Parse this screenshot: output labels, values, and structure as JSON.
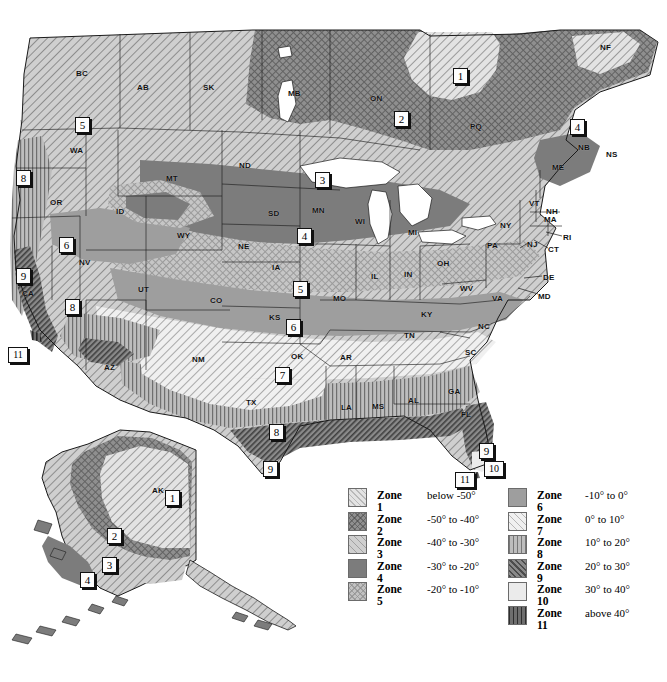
{
  "background": "#ffffff",
  "legend": {
    "left_column": [
      {
        "zone": "Zone 1",
        "range": "below -50°",
        "swatch": "z1"
      },
      {
        "zone": "Zone 2",
        "range": "-50° to -40°",
        "swatch": "z2"
      },
      {
        "zone": "Zone 3",
        "range": "-40° to -30°",
        "swatch": "z3"
      },
      {
        "zone": "Zone 4",
        "range": "-30° to -20°",
        "swatch": "z4"
      },
      {
        "zone": "Zone 5",
        "range": "-20° to -10°",
        "swatch": "z5"
      }
    ],
    "right_column": [
      {
        "zone": "Zone 6",
        "range": "-10° to 0°",
        "swatch": "z6"
      },
      {
        "zone": "Zone 7",
        "range": "0° to 10°",
        "swatch": "z7"
      },
      {
        "zone": "Zone 8",
        "range": "10° to 20°",
        "swatch": "z8"
      },
      {
        "zone": "Zone 9",
        "range": "20° to 30°",
        "swatch": "z9"
      },
      {
        "zone": "Zone 10",
        "range": "30° to 40°",
        "swatch": "z10"
      },
      {
        "zone": "Zone 11",
        "range": "above 40°",
        "swatch": "z11"
      }
    ]
  },
  "zone_colors": {
    "zone1": "#e3e3e3",
    "zone2": "#8f8f8f",
    "zone3": "#cfcfcf",
    "zone4": "#7c7c7c",
    "zone5": "#c2c2c2",
    "zone6": "#9e9e9e",
    "zone7": "#f0f0f0",
    "zone8": "#bdbdbd",
    "zone9": "#8a8a8a",
    "zone10": "#ebebeb",
    "zone11": "#6e6e6e",
    "water": "#ffffff",
    "border": "#1a1a1a"
  },
  "region_labels": [
    {
      "text": "BC",
      "x": 76,
      "y": 69
    },
    {
      "text": "AB",
      "x": 137,
      "y": 83
    },
    {
      "text": "SK",
      "x": 203,
      "y": 83
    },
    {
      "text": "MB",
      "x": 288,
      "y": 89
    },
    {
      "text": "ON",
      "x": 370,
      "y": 94
    },
    {
      "text": "PQ",
      "x": 470,
      "y": 122
    },
    {
      "text": "NF",
      "x": 600,
      "y": 43
    },
    {
      "text": "NB",
      "x": 578,
      "y": 143
    },
    {
      "text": "NS",
      "x": 606,
      "y": 150
    },
    {
      "text": "ME",
      "x": 552,
      "y": 163
    },
    {
      "text": "WA",
      "x": 70,
      "y": 146
    },
    {
      "text": "OR",
      "x": 50,
      "y": 198
    },
    {
      "text": "ID",
      "x": 116,
      "y": 207
    },
    {
      "text": "MT",
      "x": 166,
      "y": 174
    },
    {
      "text": "ND",
      "x": 239,
      "y": 161
    },
    {
      "text": "SD",
      "x": 268,
      "y": 209
    },
    {
      "text": "MN",
      "x": 312,
      "y": 206
    },
    {
      "text": "WI",
      "x": 355,
      "y": 217
    },
    {
      "text": "MI",
      "x": 408,
      "y": 228
    },
    {
      "text": "NY",
      "x": 500,
      "y": 221
    },
    {
      "text": "VT",
      "x": 529,
      "y": 199
    },
    {
      "text": "NH",
      "x": 546,
      "y": 207
    },
    {
      "text": "MA",
      "x": 544,
      "y": 215
    },
    {
      "text": "RI",
      "x": 563,
      "y": 233
    },
    {
      "text": "CT",
      "x": 548,
      "y": 245
    },
    {
      "text": "NJ",
      "x": 527,
      "y": 240
    },
    {
      "text": "PA",
      "x": 487,
      "y": 241
    },
    {
      "text": "DE",
      "x": 543,
      "y": 273
    },
    {
      "text": "MD",
      "x": 538,
      "y": 292
    },
    {
      "text": "OH",
      "x": 437,
      "y": 259
    },
    {
      "text": "IN",
      "x": 404,
      "y": 270
    },
    {
      "text": "IL",
      "x": 371,
      "y": 272
    },
    {
      "text": "IA",
      "x": 272,
      "y": 263
    },
    {
      "text": "NE",
      "x": 238,
      "y": 242
    },
    {
      "text": "WY",
      "x": 177,
      "y": 231
    },
    {
      "text": "NV",
      "x": 79,
      "y": 258
    },
    {
      "text": "UT",
      "x": 138,
      "y": 285
    },
    {
      "text": "CA",
      "x": 22,
      "y": 289
    },
    {
      "text": "CO",
      "x": 210,
      "y": 296
    },
    {
      "text": "KS",
      "x": 269,
      "y": 313
    },
    {
      "text": "MO",
      "x": 333,
      "y": 294
    },
    {
      "text": "KY",
      "x": 421,
      "y": 310
    },
    {
      "text": "WV",
      "x": 460,
      "y": 284
    },
    {
      "text": "VA",
      "x": 492,
      "y": 294
    },
    {
      "text": "NC",
      "x": 478,
      "y": 322
    },
    {
      "text": "SC",
      "x": 465,
      "y": 348
    },
    {
      "text": "TN",
      "x": 404,
      "y": 331
    },
    {
      "text": "AR",
      "x": 340,
      "y": 353
    },
    {
      "text": "OK",
      "x": 291,
      "y": 352
    },
    {
      "text": "NM",
      "x": 192,
      "y": 355
    },
    {
      "text": "AZ",
      "x": 104,
      "y": 363
    },
    {
      "text": "TX",
      "x": 246,
      "y": 398
    },
    {
      "text": "LA",
      "x": 341,
      "y": 403
    },
    {
      "text": "MS",
      "x": 372,
      "y": 402
    },
    {
      "text": "AL",
      "x": 408,
      "y": 396
    },
    {
      "text": "GA",
      "x": 448,
      "y": 387
    },
    {
      "text": "FL",
      "x": 461,
      "y": 410
    },
    {
      "text": "AK",
      "x": 152,
      "y": 486
    }
  ],
  "zone_markers": [
    {
      "zone": "1",
      "x": 453,
      "y": 68
    },
    {
      "zone": "2",
      "x": 394,
      "y": 111
    },
    {
      "zone": "4",
      "x": 570,
      "y": 119
    },
    {
      "zone": "5",
      "x": 75,
      "y": 117
    },
    {
      "zone": "8",
      "x": 16,
      "y": 170
    },
    {
      "zone": "3",
      "x": 315,
      "y": 172
    },
    {
      "zone": "6",
      "x": 59,
      "y": 237
    },
    {
      "zone": "4",
      "x": 297,
      "y": 228
    },
    {
      "zone": "9",
      "x": 16,
      "y": 268
    },
    {
      "zone": "5",
      "x": 293,
      "y": 281
    },
    {
      "zone": "8",
      "x": 65,
      "y": 299
    },
    {
      "zone": "6",
      "x": 286,
      "y": 319
    },
    {
      "zone": "11",
      "x": 8,
      "y": 347,
      "wide": true
    },
    {
      "zone": "7",
      "x": 275,
      "y": 367
    },
    {
      "zone": "8",
      "x": 269,
      "y": 424
    },
    {
      "zone": "9",
      "x": 263,
      "y": 461
    },
    {
      "zone": "9",
      "x": 479,
      "y": 443
    },
    {
      "zone": "10",
      "x": 484,
      "y": 461,
      "wide": true
    },
    {
      "zone": "11",
      "x": 455,
      "y": 472,
      "wide": true
    },
    {
      "zone": "1",
      "x": 165,
      "y": 490
    },
    {
      "zone": "2",
      "x": 107,
      "y": 528
    },
    {
      "zone": "3",
      "x": 102,
      "y": 557
    },
    {
      "zone": "4",
      "x": 80,
      "y": 572
    }
  ]
}
